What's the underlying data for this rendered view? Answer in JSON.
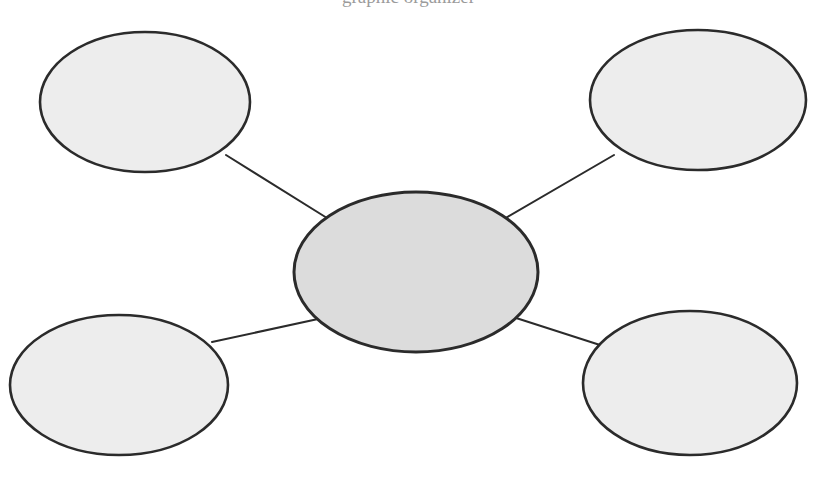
{
  "document": {
    "title_fragment": "graphic organizer",
    "background_color": "#ffffff",
    "width": 817,
    "height": 481
  },
  "diagram": {
    "type": "cluster-web-graphic-organizer",
    "stroke_color": "#2b2b2b",
    "center_fill": "#dcdcdc",
    "satellite_fill": "#ededed",
    "connector_color": "#2b2b2b",
    "center": {
      "id": "center-ellipse",
      "label": "",
      "cx": 416,
      "cy": 272,
      "rx": 122,
      "ry": 80
    },
    "satellites": [
      {
        "id": "top-left-ellipse",
        "label": "",
        "cx": 145,
        "cy": 102,
        "rx": 105,
        "ry": 70
      },
      {
        "id": "top-right-ellipse",
        "label": "",
        "cx": 698,
        "cy": 100,
        "rx": 108,
        "ry": 70
      },
      {
        "id": "bottom-left-ellipse",
        "label": "",
        "cx": 119,
        "cy": 385,
        "rx": 109,
        "ry": 70
      },
      {
        "id": "bottom-right-ellipse",
        "label": "",
        "cx": 690,
        "cy": 383,
        "rx": 107,
        "ry": 72
      }
    ],
    "connectors": [
      {
        "id": "connector-top-left",
        "from": "center-ellipse",
        "to": "top-left-ellipse",
        "x1": 327,
        "y1": 218,
        "x2": 226,
        "y2": 155
      },
      {
        "id": "connector-top-right",
        "from": "center-ellipse",
        "to": "top-right-ellipse",
        "x1": 504,
        "y1": 219,
        "x2": 614,
        "y2": 155
      },
      {
        "id": "connector-bottom-left",
        "from": "center-ellipse",
        "to": "bottom-left-ellipse",
        "x1": 318,
        "y1": 319,
        "x2": 212,
        "y2": 342
      },
      {
        "id": "connector-bottom-right",
        "from": "center-ellipse",
        "to": "bottom-right-ellipse",
        "x1": 513,
        "y1": 317,
        "x2": 600,
        "y2": 345
      }
    ]
  }
}
